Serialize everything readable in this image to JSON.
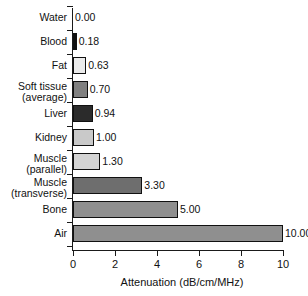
{
  "chart_data": {
    "type": "bar",
    "orientation": "horizontal",
    "title": "",
    "xlabel": "Attenuation (dB/cm/MHz)",
    "ylabel": "",
    "xlim": [
      0,
      10
    ],
    "xticks": [
      0,
      2,
      4,
      6,
      8,
      10
    ],
    "xtick_labels": [
      "0",
      "2",
      "4",
      "6",
      "8",
      "10"
    ],
    "grid": false,
    "legend": false,
    "categories": [
      "Water",
      "Blood",
      "Fat",
      "Soft tissue\n(average)",
      "Liver",
      "Kidney",
      "Muscle\n(parallel)",
      "Muscle\n(transverse)",
      "Bone",
      "Air"
    ],
    "values": [
      0.0,
      0.18,
      0.63,
      0.7,
      0.94,
      1.0,
      1.3,
      3.3,
      5.0,
      10.0
    ],
    "value_labels": [
      "0.00",
      "0.18",
      "0.63",
      "0.70",
      "0.94",
      "1.00",
      "1.30",
      "3.30",
      "5.00",
      "10.00"
    ],
    "bar_colors": [
      "#ffffff",
      "#101010",
      "#ebebeb",
      "#808080",
      "#2b2b2b",
      "#c9c9c9",
      "#d4d4d4",
      "#6e6e6e",
      "#8f8f8f",
      "#8f8f8f"
    ],
    "bar_edge_color": "#111111",
    "axis_color": "#1a1a1a",
    "background_color": "#ffffff",
    "text_color": "#111111"
  }
}
